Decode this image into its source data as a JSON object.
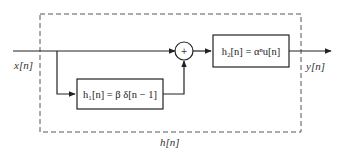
{
  "diagram": {
    "type": "block-diagram",
    "input_label": "x[n]",
    "output_label": "y[n]",
    "system_label": "h[n]",
    "adder_symbol": "+",
    "blocks": [
      {
        "id": "h1",
        "label": "h₁[n] = β δ[n − 1]"
      },
      {
        "id": "h2",
        "label": "h₂[n] = αⁿu[n]"
      }
    ],
    "colors": {
      "line": "#222222",
      "dashed_border": "#555555",
      "background": "#ffffff"
    }
  }
}
